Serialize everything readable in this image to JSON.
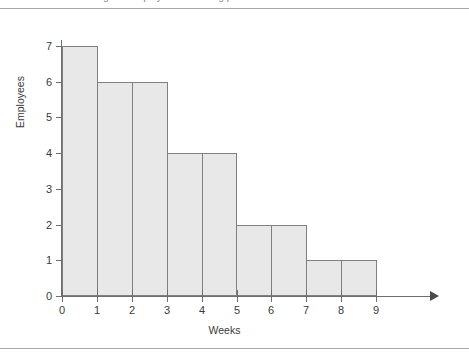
{
  "caption": {
    "text": "Figure: Employees remaining per week vs. schedule"
  },
  "axis_titles": {
    "y": "Employees",
    "x": "Weeks"
  },
  "ticks": {
    "y": [
      "7",
      "6",
      "5",
      "4",
      "3",
      "2",
      "1",
      "0"
    ],
    "x": [
      "0",
      "1",
      "2",
      "3",
      "4",
      "5",
      "6",
      "7",
      "8",
      "9"
    ]
  },
  "colors": {
    "bar_fill": "#e8e8e8",
    "bar_stroke": "#808080",
    "axis": "#6e6e6e",
    "text": "#3a3a3a",
    "page_rule": "#a8a8a8",
    "background": "#ffffff"
  },
  "chart_data": {
    "type": "bar",
    "title": "",
    "subtitle": "",
    "xlabel": "Weeks",
    "ylabel": "Employees",
    "categories": [
      "0-1",
      "1-2",
      "2-3",
      "3-4",
      "4-5",
      "5-6",
      "6-7",
      "7-8",
      "8-9"
    ],
    "values": [
      7,
      6,
      6,
      4,
      4,
      2,
      2,
      1,
      1
    ],
    "bin_edges": [
      0,
      1,
      2,
      3,
      4,
      5,
      6,
      7,
      8,
      9
    ],
    "xlim": [
      0,
      9
    ],
    "ylim": [
      0,
      7
    ],
    "x_tick_labels": [
      "0",
      "1",
      "2",
      "3",
      "4",
      "5",
      "6",
      "7",
      "8",
      "9"
    ],
    "y_tick_labels": [
      "0",
      "1",
      "2",
      "3",
      "4",
      "5",
      "6",
      "7"
    ],
    "grid": false,
    "legend": null,
    "legend_position": "none",
    "bar_gap": 0,
    "annotations": [],
    "style": "histogram, adjacent bars, light gray fill with gray outline, x-axis terminates in arrowhead"
  }
}
